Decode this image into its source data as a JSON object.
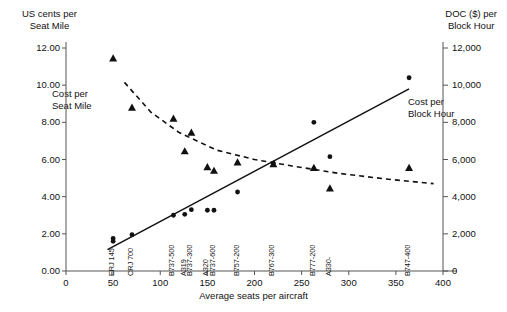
{
  "chart_data": {
    "type": "scatter",
    "title": "",
    "xlabel": "Average seats per aircraft",
    "ylabel_left": "US cents per\nSeat Mile",
    "ylabel_right": "DOC ($) per\nBlock Hour",
    "xlim": [
      0,
      400
    ],
    "ylim_left": [
      0,
      12
    ],
    "ylim_right": [
      0,
      12000
    ],
    "xticks": [
      "0",
      "50",
      "100",
      "150",
      "200",
      "250",
      "300",
      "350",
      "400"
    ],
    "xtick_values": [
      0,
      50,
      100,
      150,
      200,
      250,
      300,
      350,
      400
    ],
    "yticks_left": [
      "0.00",
      "2.00",
      "4.00",
      "6.00",
      "8.00",
      "10.00",
      "12.00"
    ],
    "ytick_left_values": [
      0,
      2,
      4,
      6,
      8,
      10,
      12
    ],
    "yticks_right": [
      "0",
      "2,000",
      "4,000",
      "6,000",
      "8,000",
      "10,000",
      "12,000"
    ],
    "ytick_right_values": [
      0,
      2000,
      4000,
      6000,
      8000,
      10000,
      12000
    ],
    "grid": false,
    "legend_position": "inline-annotations",
    "annotations": [
      {
        "name": "seat-mile-annotation",
        "text": "Cost per\nSeat Mile",
        "x": 62,
        "y": 9.3
      },
      {
        "name": "block-hour-annotation",
        "text": "Cost per\nBlock Hour",
        "x": 325,
        "y": 8.9
      }
    ],
    "aircraft_labels": [
      {
        "name": "ERJ 145",
        "x": 50
      },
      {
        "name": "CRJ 700",
        "x": 70
      },
      {
        "name": "B737-500",
        "x": 114
      },
      {
        "name": "A319",
        "x": 126
      },
      {
        "name": "B737-300",
        "x": 133
      },
      {
        "name": "A320",
        "x": 150
      },
      {
        "name": "B737-600",
        "x": 157
      },
      {
        "name": "B757-200",
        "x": 182
      },
      {
        "name": "B767-300",
        "x": 220
      },
      {
        "name": "B777-200",
        "x": 263
      },
      {
        "name": "A330-",
        "x": 280
      },
      {
        "name": "B747-400",
        "x": 364
      }
    ],
    "series": [
      {
        "name": "Cost per Seat Mile",
        "marker": "triangle",
        "axis": "left",
        "unit": "US cents per seat mile",
        "points": [
          {
            "x": 50,
            "y": 11.45
          },
          {
            "x": 70,
            "y": 8.8
          },
          {
            "x": 114,
            "y": 8.2
          },
          {
            "x": 133,
            "y": 7.45
          },
          {
            "x": 126,
            "y": 6.45
          },
          {
            "x": 150,
            "y": 5.6
          },
          {
            "x": 157,
            "y": 5.4
          },
          {
            "x": 182,
            "y": 5.85
          },
          {
            "x": 220,
            "y": 5.75
          },
          {
            "x": 263,
            "y": 5.55
          },
          {
            "x": 280,
            "y": 4.45
          },
          {
            "x": 364,
            "y": 5.55
          }
        ]
      },
      {
        "name": "Cost per Block Hour",
        "marker": "circle",
        "axis": "right",
        "unit": "DOC ($) per block hour",
        "points": [
          {
            "x": 50,
            "y": 1750
          },
          {
            "x": 50,
            "y": 1600
          },
          {
            "x": 70,
            "y": 1950
          },
          {
            "x": 114,
            "y": 3000
          },
          {
            "x": 126,
            "y": 3050
          },
          {
            "x": 133,
            "y": 3300
          },
          {
            "x": 150,
            "y": 3270
          },
          {
            "x": 157,
            "y": 3270
          },
          {
            "x": 182,
            "y": 4250
          },
          {
            "x": 220,
            "y": 5800
          },
          {
            "x": 263,
            "y": 8000
          },
          {
            "x": 280,
            "y": 6150
          },
          {
            "x": 364,
            "y": 10400
          }
        ]
      }
    ],
    "trendlines": [
      {
        "name": "seat-mile-trendline",
        "style": "dashed",
        "axis": "left",
        "points": [
          {
            "x": 62,
            "y": 10.15
          },
          {
            "x": 90,
            "y": 8.55
          },
          {
            "x": 120,
            "y": 7.45
          },
          {
            "x": 160,
            "y": 6.5
          },
          {
            "x": 200,
            "y": 6.0
          },
          {
            "x": 240,
            "y": 5.65
          },
          {
            "x": 290,
            "y": 5.25
          },
          {
            "x": 340,
            "y": 4.95
          },
          {
            "x": 390,
            "y": 4.7
          }
        ]
      },
      {
        "name": "block-hour-trendline",
        "style": "solid",
        "axis": "right",
        "points": [
          {
            "x": 44,
            "y": 1150
          },
          {
            "x": 364,
            "y": 9800
          }
        ]
      }
    ]
  }
}
